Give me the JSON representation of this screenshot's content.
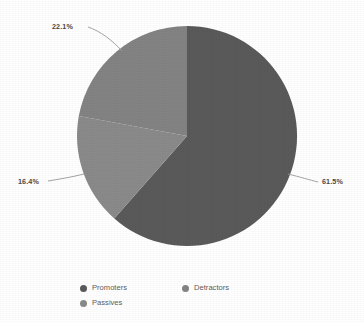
{
  "chart_data": {
    "type": "pie",
    "title": "",
    "subtitle": "",
    "xlabel": "",
    "ylabel": "",
    "grid": false,
    "legend_position": "bottom",
    "start_angle_deg": 0,
    "direction": "clockwise",
    "center": {
      "x": 187,
      "y": 136
    },
    "radius": 110,
    "categories": [
      "Promoters",
      "Detractors",
      "Passives"
    ],
    "values": [
      61.5,
      22.1,
      16.4
    ],
    "value_unit": "%",
    "slices": [
      {
        "name": "Promoters",
        "value": 61.5,
        "label": "61.5%",
        "color": "#5a5a5a",
        "start_deg": 0.0,
        "end_deg": 221.4,
        "label_x": 322,
        "label_y": 178
      },
      {
        "name": "Passives",
        "value": 16.4,
        "label": "16.4%",
        "color": "#8a8a8a",
        "start_deg": 221.4,
        "end_deg": 280.4,
        "label_x": 18,
        "label_y": 178
      },
      {
        "name": "Detractors",
        "value": 22.1,
        "label": "22.1%",
        "color": "#838383",
        "start_deg": 280.4,
        "end_deg": 360.0,
        "label_x": 52,
        "label_y": 23
      }
    ],
    "annotations": [
      {
        "text": "22.1%",
        "target": "Detractors"
      },
      {
        "text": "16.4%",
        "target": "Passives"
      },
      {
        "text": "61.5%",
        "target": "Promoters"
      }
    ]
  },
  "labels": {
    "detractors_pct": "22.1%",
    "passives_pct": "16.4%",
    "promoters_pct": "61.5%"
  },
  "legend": {
    "row1": [
      {
        "label": "Promoters",
        "color": "#5a5a5a"
      },
      {
        "label": "Detractors",
        "color": "#838383"
      }
    ],
    "row2": [
      {
        "label": "Passives",
        "color": "#8a8a8a"
      }
    ]
  },
  "colors": {
    "background": "#ffffff",
    "promoters": "#5a5a5a",
    "detractors": "#838383",
    "passives": "#8a8a8a",
    "label_text": "#4a4a4a",
    "legend_text": "#5d5d5d",
    "leader_line": "#9a9a9a"
  }
}
